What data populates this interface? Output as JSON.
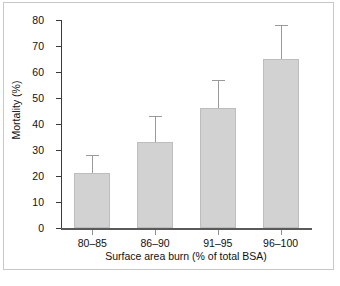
{
  "chart_data": {
    "type": "bar",
    "title": "",
    "xlabel": "Surface area burn (% of total BSA)",
    "ylabel": "Mortality (%)",
    "categories": [
      "80–85",
      "86–90",
      "91–95",
      "96–100"
    ],
    "values": [
      21,
      33,
      46,
      65
    ],
    "error_upper": [
      28,
      43,
      57,
      78
    ],
    "error_bars": "upper only",
    "ylim": [
      0,
      80
    ],
    "yticks": [
      0,
      10,
      20,
      30,
      40,
      50,
      60,
      70,
      80
    ],
    "ytick_labels": [
      "0",
      "10",
      "20",
      "30",
      "40",
      "50",
      "60",
      "70",
      "80"
    ],
    "grid": false,
    "legend": false,
    "bar_color": "#d2d2d2",
    "bar_edge_color": "#bdbdbd",
    "error_color": "#9a9a9a",
    "axis_color": "#3a3a3a",
    "frame_color": "#c8c8c8"
  }
}
